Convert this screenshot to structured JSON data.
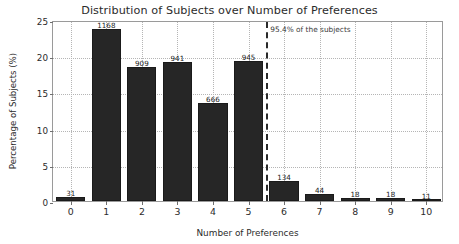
{
  "chart_data": {
    "type": "bar",
    "title": "Distribution of Subjects over Number of Preferences",
    "xlabel": "Number of Preferences",
    "ylabel": "Percentage of Subjects (%)",
    "categories": [
      "0",
      "1",
      "2",
      "3",
      "4",
      "5",
      "6",
      "7",
      "8",
      "9",
      "10"
    ],
    "values": [
      0.6,
      23.8,
      18.5,
      19.2,
      13.6,
      19.3,
      2.7,
      0.9,
      0.4,
      0.4,
      0.2
    ],
    "bar_labels": [
      "31",
      "1168",
      "909",
      "941",
      "666",
      "945",
      "134",
      "44",
      "18",
      "18",
      "11"
    ],
    "ylim": [
      0,
      25
    ],
    "xlim": [
      -0.5,
      10.5
    ],
    "yticks": [
      0,
      5,
      10,
      15,
      20,
      25
    ],
    "ytick_labels": [
      "0",
      "5",
      "10",
      "15",
      "20",
      "25"
    ],
    "xticks": [
      0,
      1,
      2,
      3,
      4,
      5,
      6,
      7,
      8,
      9,
      10
    ],
    "grid": true,
    "legend": false,
    "bar_color": "#262626",
    "annotations": [
      {
        "name": "threshold",
        "text": "95.4% of the subjects",
        "x": 5.5,
        "style": "dashed-vertical-line",
        "color": "#2a2a2a"
      }
    ]
  }
}
